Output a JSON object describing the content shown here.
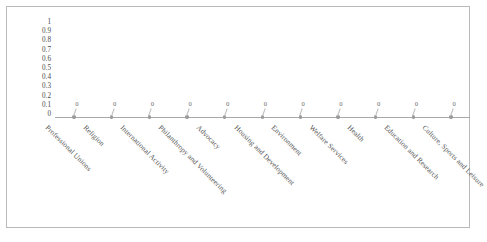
{
  "chart_data": {
    "type": "scatter",
    "title": "",
    "subtitle": "",
    "xlabel": "",
    "ylabel": "",
    "ylim": [
      0,
      1
    ],
    "grid": false,
    "legend": false,
    "legend_position": "none",
    "y_tick_labels": [
      "1",
      "0.9",
      "0.8",
      "0.7",
      "0.6",
      "0.5",
      "0.4",
      "0.3",
      "0.2",
      "0.1",
      "0"
    ],
    "categories": [
      "Professional Unions",
      "Religion",
      "International Activity",
      "Philanthropy and Volunteering",
      "Advocacy",
      "Housing and Development",
      "Environment",
      "Welfare Services",
      "Health",
      "Education and Research",
      "Culture, Sports and Leisure"
    ],
    "values": [
      0,
      0,
      0,
      0,
      0,
      0,
      0,
      0,
      0,
      0,
      0
    ],
    "data_labels": [
      "0",
      "0",
      "0",
      "0",
      "0",
      "0",
      "0",
      "0",
      "0",
      "0",
      "0"
    ],
    "colors": {
      "series_line": "#a8a8a8",
      "marker": "#9a9a9a",
      "data_label_text": "#6d6d6d",
      "axis_text": "#555555",
      "frame_border": "#b9b9b9",
      "plot_background": "#ffffff"
    }
  }
}
